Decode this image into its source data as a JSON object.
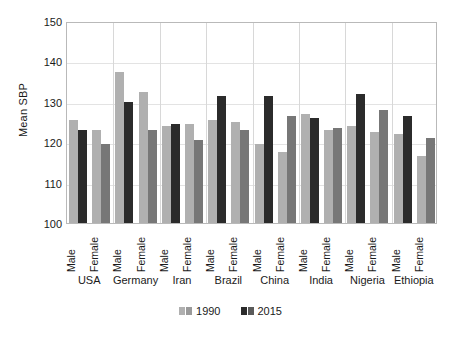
{
  "chart_data": {
    "type": "bar",
    "title": "",
    "xlabel": "",
    "ylabel": "Mean SBP",
    "ylim": [
      100,
      150
    ],
    "ytick_labels": [
      "150",
      "140",
      "130",
      "120",
      "110",
      "100"
    ],
    "yticks": [
      150,
      140,
      130,
      120,
      110,
      100
    ],
    "grid": true,
    "legend_position": "bottom-center",
    "categories": [
      "USA",
      "Germany",
      "Iran",
      "Brazil",
      "China",
      "India",
      "Nigeria",
      "Ethiopia"
    ],
    "sex_categories": [
      "Male",
      "Female"
    ],
    "series": [
      {
        "name": "1990",
        "color": "#b0b0b0",
        "male": [
          125.5,
          137.5,
          124.0,
          125.5,
          119.5,
          127.0,
          124.0,
          122.0
        ],
        "female": [
          123.0,
          132.5,
          124.5,
          125.0,
          117.5,
          123.0,
          122.5,
          116.5
        ]
      },
      {
        "name": "2015",
        "color": "#2b2b2b",
        "male": [
          123.0,
          130.0,
          124.5,
          131.5,
          131.5,
          126.0,
          132.0,
          126.5
        ],
        "female": [
          119.5,
          123.0,
          120.5,
          123.0,
          126.5,
          123.5,
          128.0,
          121.0
        ]
      }
    ],
    "legend": [
      {
        "label": "1990",
        "color": "#b0b0b0"
      },
      {
        "label": "2015",
        "color": "#2b2b2b"
      }
    ]
  }
}
